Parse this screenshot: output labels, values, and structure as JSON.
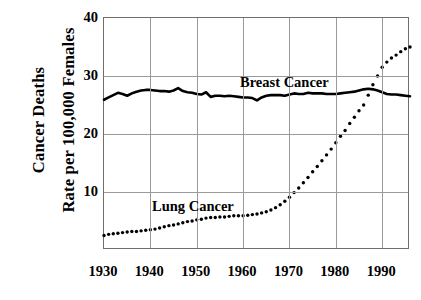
{
  "axis": {
    "y_title_line1": "Cancer Deaths",
    "y_title_line2": "Rate per 100,000 Females",
    "y_ticks": [
      10,
      20,
      30,
      40
    ],
    "x_ticks": [
      1930,
      1940,
      1950,
      1960,
      1970,
      1980,
      1990
    ]
  },
  "labels": {
    "breast": "Breast Cancer",
    "lung": "Lung Cancer"
  },
  "colors": {
    "series": "#000000",
    "grid": "#9a9a9a",
    "frame": "#6e6e6e",
    "background": "#ffffff"
  },
  "chart_data": {
    "type": "line",
    "title": "",
    "subtitle": "",
    "xlabel": "",
    "ylabel": "Cancer Deaths Rate per 100,000 Females",
    "xlim": [
      1930,
      1996
    ],
    "ylim": [
      0,
      40
    ],
    "grid": true,
    "legend": "inline-annotations",
    "xticks": [
      1930,
      1940,
      1950,
      1960,
      1970,
      1980,
      1990
    ],
    "yticks": [
      10,
      20,
      30,
      40
    ],
    "x": [
      1930,
      1931,
      1932,
      1933,
      1934,
      1935,
      1936,
      1937,
      1938,
      1939,
      1940,
      1941,
      1942,
      1943,
      1944,
      1945,
      1946,
      1947,
      1948,
      1949,
      1950,
      1951,
      1952,
      1953,
      1954,
      1955,
      1956,
      1957,
      1958,
      1959,
      1960,
      1961,
      1962,
      1963,
      1964,
      1965,
      1966,
      1967,
      1968,
      1969,
      1970,
      1971,
      1972,
      1973,
      1974,
      1975,
      1976,
      1977,
      1978,
      1979,
      1980,
      1981,
      1982,
      1983,
      1984,
      1985,
      1986,
      1987,
      1988,
      1989,
      1990,
      1991,
      1992,
      1993,
      1994,
      1995,
      1996
    ],
    "series": [
      {
        "name": "Breast Cancer",
        "style": "solid-line",
        "values": [
          25.9,
          26.3,
          26.7,
          27.1,
          26.9,
          26.6,
          27.0,
          27.3,
          27.5,
          27.6,
          27.6,
          27.5,
          27.4,
          27.4,
          27.3,
          27.5,
          27.9,
          27.4,
          27.2,
          27.1,
          26.9,
          26.8,
          27.2,
          26.4,
          26.6,
          26.6,
          26.5,
          26.6,
          26.5,
          26.4,
          26.3,
          26.3,
          26.2,
          25.8,
          26.3,
          26.6,
          26.7,
          26.7,
          26.7,
          26.6,
          26.8,
          27.0,
          26.9,
          26.9,
          27.1,
          27.0,
          27.0,
          27.0,
          26.9,
          26.9,
          26.9,
          27.0,
          27.1,
          27.2,
          27.3,
          27.5,
          27.7,
          27.8,
          27.7,
          27.5,
          27.2,
          26.9,
          26.8,
          26.8,
          26.7,
          26.6,
          26.5
        ]
      },
      {
        "name": "Lung Cancer",
        "style": "dotted-markers",
        "values": [
          2.5,
          2.7,
          2.8,
          2.9,
          3.0,
          3.1,
          3.2,
          3.2,
          3.3,
          3.4,
          3.5,
          3.6,
          3.8,
          4.0,
          4.2,
          4.3,
          4.5,
          4.7,
          4.9,
          5.0,
          5.2,
          5.3,
          5.5,
          5.6,
          5.6,
          5.7,
          5.7,
          5.8,
          5.9,
          5.9,
          5.9,
          6.0,
          6.1,
          6.2,
          6.4,
          6.6,
          6.9,
          7.3,
          7.8,
          8.4,
          9.1,
          9.9,
          10.7,
          11.6,
          12.5,
          13.5,
          14.4,
          15.4,
          16.4,
          17.4,
          18.5,
          19.6,
          20.6,
          21.8,
          22.9,
          24.0,
          25.0,
          26.7,
          28.5,
          30.0,
          31.5,
          32.4,
          33.1,
          33.6,
          34.2,
          34.7,
          35.0
        ]
      }
    ]
  }
}
